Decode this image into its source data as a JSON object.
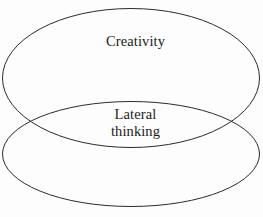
{
  "diagram": {
    "type": "venn-two-set-vertical-overlap",
    "background_color": "#fdfdfd",
    "stroke_color": "#2b2b2b",
    "text_color": "#1a1a1a",
    "sets": [
      {
        "id": "creativity",
        "label": "Creativity",
        "position": "upper-ellipse",
        "fill": "none"
      },
      {
        "id": "lateral-thinking",
        "label_line_1": "Lateral",
        "label_line_2": "thinking",
        "label": "Lateral thinking",
        "position": "intersection-region",
        "fill": "none"
      }
    ],
    "ellipses": [
      {
        "id": "upper-ellipse",
        "cx": 131,
        "cy": 78,
        "rx": 129,
        "ry": 70
      },
      {
        "id": "lower-ellipse",
        "cx": 131,
        "cy": 154,
        "rx": 129,
        "ry": 53
      }
    ]
  }
}
